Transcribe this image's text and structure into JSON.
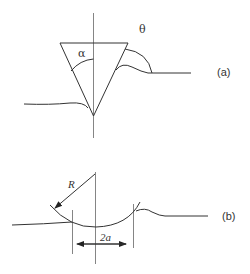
{
  "figure_a": {
    "panel_label": "(a)",
    "alpha_label": "α",
    "theta_label": "θ",
    "description": "Conical (pyramidal) indenter with half-angle alpha pressed into a surface; contact angle theta shown at pile-up"
  },
  "figure_b": {
    "panel_label": "(b)",
    "radius_label": "R",
    "contact_label": "2a",
    "description": "Spherical indenter of radius R in contact with surface; contact diameter 2a"
  }
}
